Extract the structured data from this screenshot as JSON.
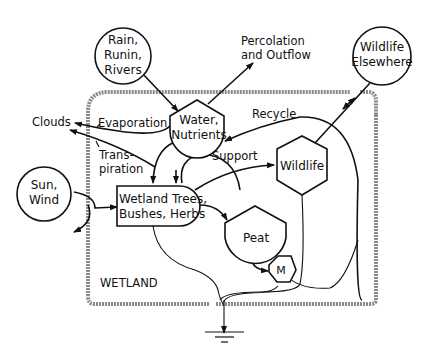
{
  "diagram": {
    "boundary_label": "WETLAND",
    "sources": {
      "rain": [
        "Rain,",
        "Runin,",
        "Rivers"
      ],
      "sun": [
        "Sun,",
        "Wind"
      ],
      "wildlife_elsewhere": [
        "Wildlife",
        "Elsewhere"
      ]
    },
    "storages": {
      "water": [
        "Water,",
        "Nutrients"
      ],
      "peat": "Peat"
    },
    "producer": [
      "Wetland Trees,",
      "Bushes, Herbs"
    ],
    "consumer": "Wildlife",
    "microbes": "M",
    "flows": {
      "percolation": [
        "Percolation",
        "and  Outflow"
      ],
      "clouds": "Clouds",
      "evaporation": "Evaporation",
      "transpiration": [
        "Trans-",
        "piration"
      ],
      "recycle": "Recycle",
      "support": "Support"
    }
  }
}
